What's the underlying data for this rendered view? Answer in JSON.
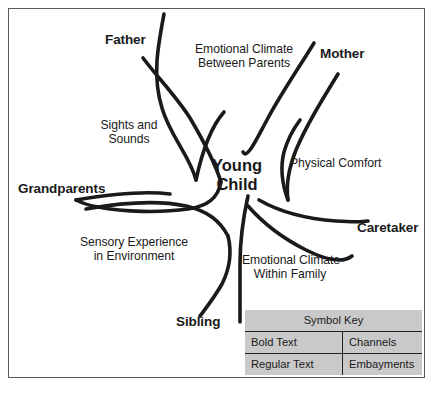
{
  "diagram": {
    "center_node": {
      "line1": "Young",
      "line2": "Child"
    },
    "channels": [
      {
        "id": "father",
        "label": "Father"
      },
      {
        "id": "mother",
        "label": "Mother"
      },
      {
        "id": "grandparents",
        "label": "Grandparents"
      },
      {
        "id": "caretaker",
        "label": "Caretaker"
      },
      {
        "id": "sibling",
        "label": "Sibling"
      }
    ],
    "embayments": [
      {
        "id": "emotional-climate-between-parents",
        "line1": "Emotional Climate",
        "line2": "Between Parents"
      },
      {
        "id": "sights-and-sounds",
        "line1": "Sights and",
        "line2": "Sounds"
      },
      {
        "id": "physical-comfort",
        "line1": "Physical Comfort",
        "line2": ""
      },
      {
        "id": "sensory-experience-in-environment",
        "line1": "Sensory Experience",
        "line2": "in Environment"
      },
      {
        "id": "emotional-climate-within-family",
        "line1": "Emotional Climate",
        "line2": "Within Family"
      }
    ],
    "colors": {
      "line": "#1a1a1a",
      "frame_border": "#5a5a5a",
      "background": "#ffffff",
      "table_fill": "#c9c9c9",
      "table_rule": "#222222"
    }
  },
  "symbol_key": {
    "title": "Symbol Key",
    "rows": [
      {
        "symbol": "Bold Text",
        "meaning": "Channels"
      },
      {
        "symbol": "Regular Text",
        "meaning": "Embayments"
      }
    ]
  }
}
